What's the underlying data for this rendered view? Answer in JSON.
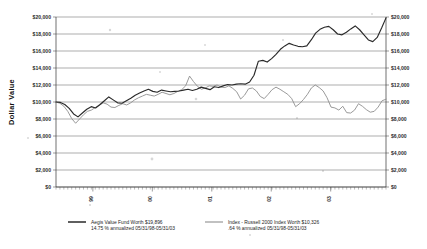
{
  "chart_data": {
    "type": "line",
    "title": "",
    "xlabel": "",
    "ylabel": "Dollar Value",
    "ylim": [
      0,
      20000
    ],
    "ytick_labels": [
      "$20,000",
      "$18,000",
      "$16,000",
      "$14,000",
      "$12,000",
      "$10,000",
      "$8,000",
      "$6,000",
      "$4,000",
      "$2,000",
      "$0"
    ],
    "ytick_values": [
      20000,
      18000,
      16000,
      14000,
      12000,
      10000,
      8000,
      6000,
      4000,
      2000,
      0
    ],
    "xtick_labels": [
      "99",
      "00",
      "01",
      "02",
      "03"
    ],
    "grid": "horizontal",
    "dual_y_axis": true,
    "legend_position": "bottom",
    "series": [
      {
        "name": "Aegis Value Fund Worth $19,896",
        "note": "14.75 % annualized 05/31/98-05/31/03",
        "color": "#2a2a2a",
        "final_value": 19896,
        "annualized_pct": 14.75,
        "period": "05/31/98-05/31/03",
        "values": [
          10000,
          9950,
          9700,
          9250,
          8600,
          8250,
          8700,
          9150,
          9450,
          9300,
          9700,
          10150,
          10600,
          10250,
          9900,
          9850,
          10150,
          10450,
          10800,
          11050,
          11300,
          11500,
          11250,
          11150,
          11400,
          11300,
          11200,
          11250,
          11300,
          11400,
          11500,
          11350,
          11500,
          11750,
          11600,
          11450,
          11800,
          11700,
          11900,
          12050,
          12000,
          12100,
          12150,
          12100,
          12350,
          13150,
          14800,
          14900,
          14700,
          15100,
          15600,
          16200,
          16600,
          16900,
          16700,
          16550,
          16500,
          16600,
          17300,
          18100,
          18550,
          18800,
          18900,
          18500,
          18000,
          17900,
          18200,
          18600,
          18950,
          18500,
          17900,
          17300,
          17100,
          17600,
          18700,
          19896
        ]
      },
      {
        "name": "Index - Russell 2000 Index Worth $10,326",
        "note": ".64 % annualized 05/31/98-05/31/03",
        "color": "#8e8e8e",
        "final_value": 10326,
        "annualized_pct": 0.64,
        "period": "05/31/98-05/31/03",
        "values": [
          10000,
          9850,
          9500,
          8900,
          8050,
          7500,
          8000,
          8500,
          8900,
          9050,
          9350,
          9600,
          9900,
          9750,
          9400,
          9350,
          9600,
          9800,
          9650,
          9900,
          10250,
          10500,
          10700,
          10900,
          10800,
          10700,
          10900,
          11150,
          11000,
          10850,
          11000,
          11250,
          11450,
          11900,
          13050,
          12400,
          11850,
          11500,
          11650,
          11900,
          11850,
          12000,
          11750,
          11700,
          11900,
          11600,
          11200,
          10350,
          10800,
          11550,
          11650,
          11300,
          10650,
          10400,
          10900,
          11450,
          11750,
          11500,
          11200,
          10900,
          10400,
          9450,
          9800,
          10300,
          10900,
          11650,
          12000,
          11700,
          11300,
          10500,
          9400,
          9300,
          9050,
          9500,
          8750,
          8700,
          9050,
          9800,
          9500,
          9100,
          8800,
          8900,
          9400,
          10150,
          10326
        ]
      }
    ]
  },
  "legend": {
    "entries": [
      {
        "label": "Aegis Value Fund Worth $19,896",
        "sub": "14.75 % annualized 05/31/98-05/31/03",
        "swatch_color": "#2a2a2a"
      },
      {
        "label": "Index - Russell 2000 Index Worth $10,326",
        "sub": ".64 % annualized 05/31/98-05/31/03",
        "swatch_color": "#8e8e8e"
      }
    ]
  }
}
